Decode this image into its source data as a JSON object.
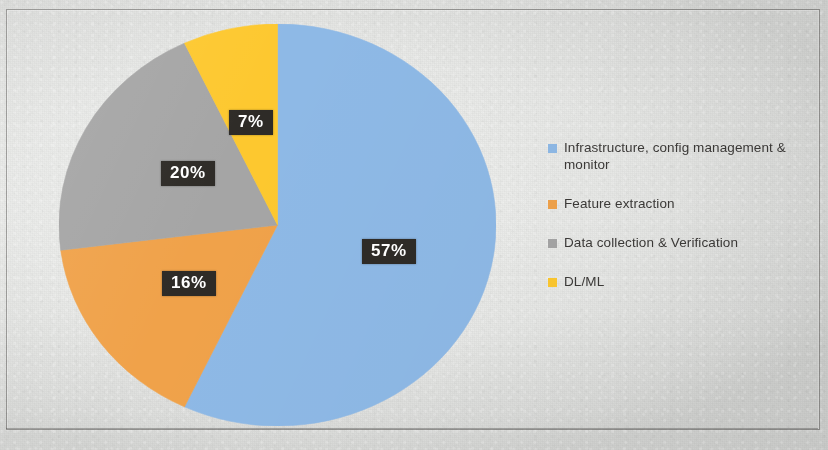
{
  "chart_data": {
    "type": "pie",
    "title": "",
    "subtitle": "",
    "xlabel": "",
    "ylabel": "",
    "grid": false,
    "legend_position": "right",
    "start_angle_deg": 0,
    "direction": "clockwise",
    "categories": [
      "Infrastructure, config management & monitor",
      "Feature extraction",
      "Data collection & Verification",
      "DL/ML"
    ],
    "values": [
      57,
      16,
      20,
      7
    ],
    "value_unit": "%",
    "data_labels": [
      "57%",
      "16%",
      "20%",
      "7%"
    ],
    "colors": [
      "#8eb9e6",
      "#f0a24a",
      "#a5a5a5",
      "#fdc82f"
    ],
    "slices": [
      {
        "label": "Infrastructure, config management & monitor",
        "value": 57,
        "data_label": "57%",
        "color": "#8eb9e6"
      },
      {
        "label": "Feature extraction",
        "value": 16,
        "data_label": "16%",
        "color": "#f0a24a"
      },
      {
        "label": "Data collection & Verification",
        "value": 20,
        "data_label": "20%",
        "color": "#a5a5a5"
      },
      {
        "label": "DL/ML",
        "value": 7,
        "data_label": "7%",
        "color": "#fdc82f"
      }
    ]
  },
  "legend": {
    "items": [
      {
        "label": "Infrastructure, config management & monitor",
        "color": "#8eb9e6",
        "swatch_name": "legend-swatch-infrastructure"
      },
      {
        "label": "Feature extraction",
        "color": "#f0a24a",
        "swatch_name": "legend-swatch-feature-extraction"
      },
      {
        "label": "Data collection & Verification",
        "color": "#a5a5a5",
        "swatch_name": "legend-swatch-data-collection"
      },
      {
        "label": "DL/ML",
        "color": "#fdc82f",
        "swatch_name": "legend-swatch-dl-ml"
      }
    ]
  },
  "labels": {
    "blue": "57%",
    "orange": "16%",
    "gray": "20%",
    "yellow": "7%"
  },
  "style": {
    "label_box_bg": "#2e2b27",
    "label_text_color": "#ffffff",
    "legend_text_color": "#3c3a38",
    "page_bg": "#e9eae8"
  }
}
